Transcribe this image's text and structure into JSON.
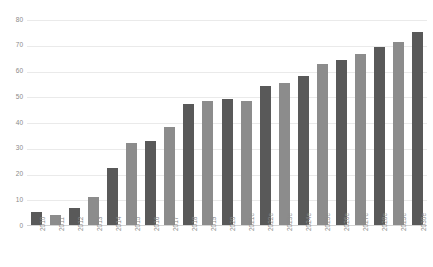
{
  "chart": {
    "title": "",
    "axis": {
      "yticks": [
        "0",
        "10",
        "20",
        "30",
        "40",
        "50",
        "60",
        "70",
        "80"
      ],
      "ylabel": "",
      "xlabel": ""
    },
    "colors": {
      "bar_dark": "#595959",
      "bar_light": "#8c8c8c",
      "gridline": "#eaeaea",
      "axis": "#d4d4d4",
      "tick_text": "#8a8a8a",
      "background": "#ffffff"
    }
  },
  "chart_data": {
    "type": "bar",
    "title": "",
    "xlabel": "",
    "ylabel": "",
    "ylim": [
      0,
      80
    ],
    "grid": true,
    "legend": "none",
    "categories": [
      "2010",
      "2011",
      "2012",
      "2013",
      "2014",
      "2015",
      "2016",
      "2017",
      "2018",
      "2019",
      "2020",
      "2021e",
      "2022e",
      "2023e",
      "2024e",
      "2025e",
      "2026e",
      "2027e",
      "2028e",
      "2029e",
      "2030e"
    ],
    "values": [
      5,
      4,
      6.5,
      11,
      22,
      32,
      32.5,
      38,
      47,
      48,
      49,
      48,
      54,
      55,
      58,
      62.5,
      64,
      66.5,
      69,
      71,
      75
    ],
    "bar_shades": [
      "dark",
      "light",
      "dark",
      "light",
      "dark",
      "light",
      "dark",
      "light",
      "dark",
      "light",
      "dark",
      "light",
      "dark",
      "light",
      "dark",
      "light",
      "dark",
      "light",
      "dark",
      "light",
      "dark"
    ]
  }
}
